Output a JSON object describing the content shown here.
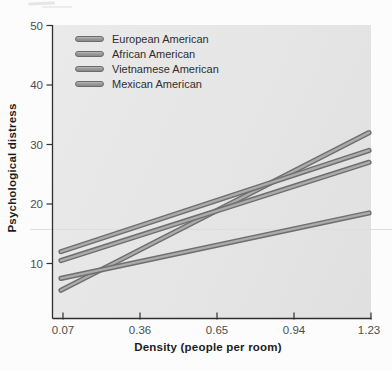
{
  "chart_data": {
    "type": "line",
    "title": "",
    "xlabel": "Density (people per room)",
    "ylabel": "Psychological distress",
    "x_ticks": [
      0.07,
      0.36,
      0.65,
      0.94,
      1.23
    ],
    "y_ticks": [
      10,
      20,
      30,
      40,
      50
    ],
    "xlim": [
      0.07,
      1.23
    ],
    "ylim": [
      0,
      50
    ],
    "grid": false,
    "legend_position": "top-left-inside",
    "series": [
      {
        "name": "European American",
        "x": [
          0.07,
          1.23
        ],
        "values": [
          5.5,
          32.0
        ]
      },
      {
        "name": "African American",
        "x": [
          0.07,
          1.23
        ],
        "values": [
          12.0,
          29.0
        ]
      },
      {
        "name": "Vietnamese American",
        "x": [
          0.07,
          1.23
        ],
        "values": [
          10.5,
          27.0
        ]
      },
      {
        "name": "Mexican American",
        "x": [
          0.07,
          1.23
        ],
        "values": [
          7.5,
          18.5
        ]
      }
    ],
    "line_fill_color": "#ababab",
    "line_edge_color": "#6e6e6e",
    "axis_color": "#2f2f2f",
    "tick_label_color": "#4d4d4d",
    "plot_bg_color": "#e5e5e5"
  }
}
